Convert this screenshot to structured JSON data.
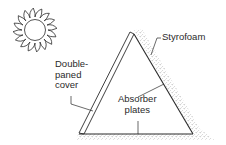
{
  "diagram": {
    "type": "solar-collector-cross-section",
    "elements": {
      "sun": {
        "icon": "sun-icon"
      },
      "collector": {
        "shape": "triangle"
      }
    },
    "labels": {
      "cover": [
        "Double-",
        "paned",
        "cover"
      ],
      "styrofoam": "Styrofoam",
      "absorber": [
        "Absorber",
        "plates"
      ]
    },
    "colors": {
      "line": "#2a2a2a",
      "stipple": "#9a9a9a",
      "background": "#ffffff"
    }
  }
}
